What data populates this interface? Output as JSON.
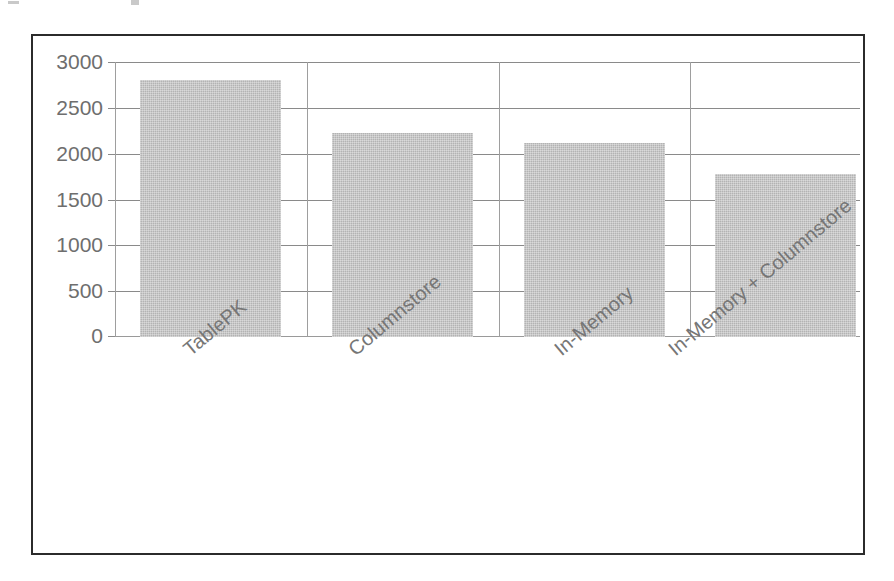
{
  "chart_data": {
    "type": "bar",
    "title": "",
    "subtitle": "",
    "xlabel": "",
    "ylabel": "",
    "categories": [
      "TablePK",
      "Columnstore",
      "In-Memory",
      "In-Memory + Columnstore"
    ],
    "values": [
      2800,
      2230,
      2120,
      1780
    ],
    "series": [
      {
        "name": "",
        "values": [
          2800,
          2230,
          2120,
          1780
        ]
      }
    ],
    "ylim": [
      0,
      3000
    ],
    "ytick_labels": [
      "3000",
      "2500",
      "2000",
      "1500",
      "1000",
      "500",
      "0"
    ],
    "ytick_values": [
      3000,
      2500,
      2000,
      1500,
      1000,
      500,
      0
    ],
    "grid": true,
    "legend": false,
    "legend_position": "none",
    "bar_color": "#b3b3b3",
    "gridline_color": "#8a8a8a",
    "axis_text_color": "#6e6e6e",
    "frame_color": "#2b2b2b",
    "background_color": "#ffffff",
    "xtick_rotation_degrees": -40
  },
  "figure": {
    "frame_border_color": "#2b2b2b",
    "plot_background": "#ffffff"
  }
}
